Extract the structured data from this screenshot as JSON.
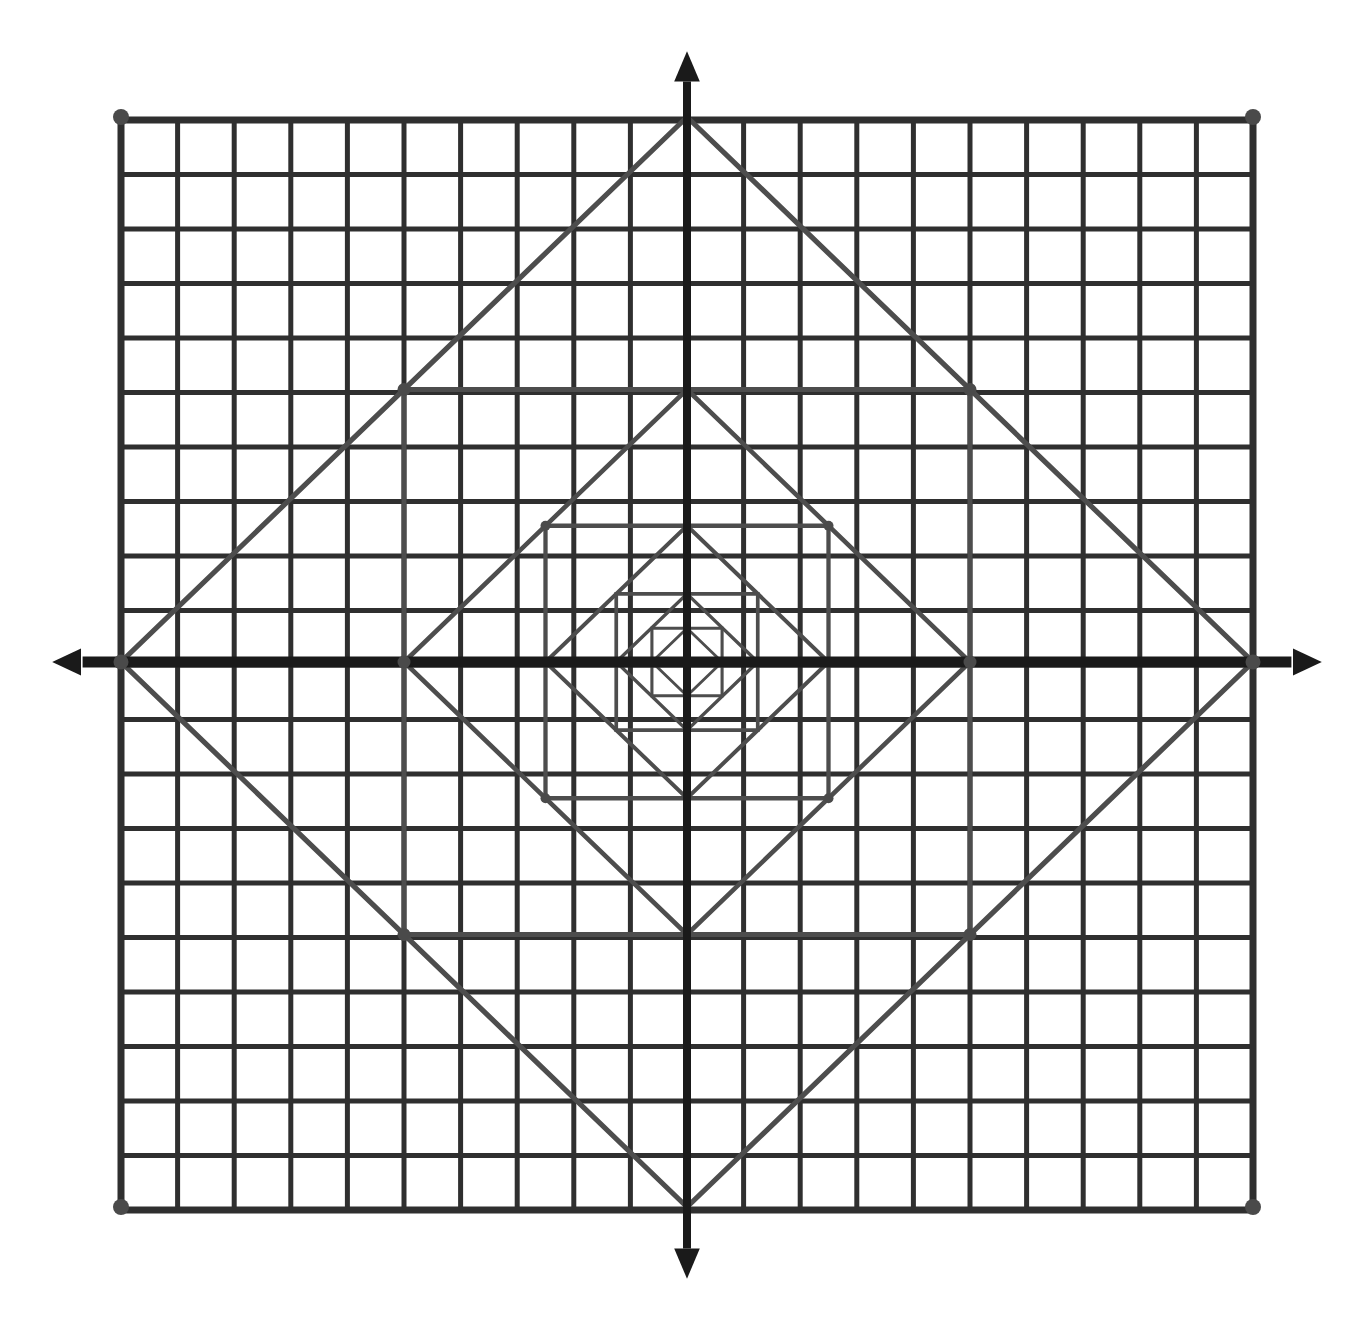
{
  "figure": {
    "kind": "geometry-diagram",
    "background_color": "#ffffff",
    "grid_color": "#2f2f2f",
    "axis_color": "#1a1a1a",
    "inscribed_color": "#4d4d4d",
    "vertex_dot_color": "#4a4a4a"
  },
  "canvas": {
    "width": 1365,
    "height": 1342
  },
  "grid": {
    "left": 121,
    "top": 120,
    "right": 1253,
    "bottom": 1210,
    "columns": 20,
    "rows": 20,
    "cell_width": 56.6,
    "cell_height": 54.5,
    "line_width": 5,
    "border_line_width": 7,
    "corner_dot_radius": 8
  },
  "axes": {
    "origin_x": 687,
    "origin_y": 662,
    "x_axis_line_width": 11,
    "y_axis_line_width": 8,
    "arrow_overshoot": 48,
    "arrow_size": 16,
    "x_label": "",
    "y_label": ""
  },
  "chart_data": {
    "type": "scatter",
    "xlabel": "",
    "ylabel": "",
    "xlim": [
      -10,
      10
    ],
    "ylim": [
      -10,
      10
    ],
    "grid": true,
    "legend": "none",
    "series": [
      {
        "name": "square-1-diamond",
        "orientation": "diamond",
        "half_size": 566,
        "vertices": [
          [
            0,
            10
          ],
          [
            10,
            0
          ],
          [
            0,
            -10
          ],
          [
            -10,
            0
          ]
        ]
      },
      {
        "name": "square-2-axis-aligned",
        "orientation": "axis-aligned",
        "half_size": 283,
        "vertices": [
          [
            -5,
            5
          ],
          [
            5,
            5
          ],
          [
            5,
            -5
          ],
          [
            -5,
            -5
          ]
        ]
      },
      {
        "name": "square-3-diamond",
        "orientation": "diamond",
        "half_size": 141.5,
        "vertices": [
          [
            0,
            5
          ],
          [
            5,
            0
          ],
          [
            0,
            -5
          ],
          [
            -5,
            0
          ]
        ]
      },
      {
        "name": "square-4-axis-aligned",
        "orientation": "axis-aligned",
        "half_size": 70.8,
        "vertices": [
          [
            -2.5,
            2.5
          ],
          [
            2.5,
            2.5
          ],
          [
            2.5,
            -2.5
          ],
          [
            -2.5,
            -2.5
          ]
        ]
      },
      {
        "name": "square-5-diamond",
        "orientation": "diamond",
        "half_size": 35.4,
        "vertices": [
          [
            0,
            2.5
          ],
          [
            2.5,
            0
          ],
          [
            0,
            -2.5
          ],
          [
            -2.5,
            0
          ]
        ]
      },
      {
        "name": "square-6-axis-aligned",
        "orientation": "axis-aligned",
        "half_size": 17.7,
        "vertices": [
          [
            -1.25,
            1.25
          ],
          [
            1.25,
            1.25
          ],
          [
            1.25,
            -1.25
          ],
          [
            -1.25,
            -1.25
          ]
        ]
      },
      {
        "name": "square-7-diamond",
        "orientation": "diamond",
        "half_size": 8.8,
        "vertices": [
          [
            0,
            1.25
          ],
          [
            1.25,
            0
          ],
          [
            0,
            -1.25
          ],
          [
            -1.25,
            0
          ]
        ]
      },
      {
        "name": "square-8-axis-aligned",
        "orientation": "axis-aligned",
        "half_size": 4.4,
        "vertices": [
          [
            -0.62,
            0.62
          ],
          [
            0.62,
            0.62
          ],
          [
            0.62,
            -0.62
          ],
          [
            -0.62,
            -0.62
          ]
        ]
      },
      {
        "name": "square-9-diamond",
        "orientation": "diamond",
        "half_size": 2.2,
        "vertices": [
          [
            0,
            0.62
          ],
          [
            0.62,
            0
          ],
          [
            0,
            -0.62
          ],
          [
            -0.62,
            0
          ]
        ]
      }
    ],
    "marked_vertices": [
      {
        "label": "grid-corner-top-left",
        "x": -10,
        "y": 10
      },
      {
        "label": "grid-corner-top-right",
        "x": 10,
        "y": 10
      },
      {
        "label": "grid-corner-bottom-left",
        "x": -10,
        "y": -10
      },
      {
        "label": "grid-corner-bottom-right",
        "x": 10,
        "y": -10
      },
      {
        "label": "diamond1-left",
        "x": -10,
        "y": 0
      },
      {
        "label": "diamond1-right",
        "x": 10,
        "y": 0
      },
      {
        "label": "square2-top-left",
        "x": -5,
        "y": 5
      },
      {
        "label": "square2-top-right",
        "x": 5,
        "y": 5
      },
      {
        "label": "square2-bottom-left",
        "x": -5,
        "y": -5
      },
      {
        "label": "square2-bottom-right",
        "x": 5,
        "y": -5
      },
      {
        "label": "diamond3-left",
        "x": -5,
        "y": 0
      },
      {
        "label": "diamond3-right",
        "x": 5,
        "y": 0
      },
      {
        "label": "square4-top-left",
        "x": -2.5,
        "y": 2.5
      },
      {
        "label": "square4-top-right",
        "x": 2.5,
        "y": 2.5
      },
      {
        "label": "square4-bottom-left",
        "x": -2.5,
        "y": -2.5
      },
      {
        "label": "square4-bottom-right",
        "x": 2.5,
        "y": -2.5
      }
    ]
  }
}
